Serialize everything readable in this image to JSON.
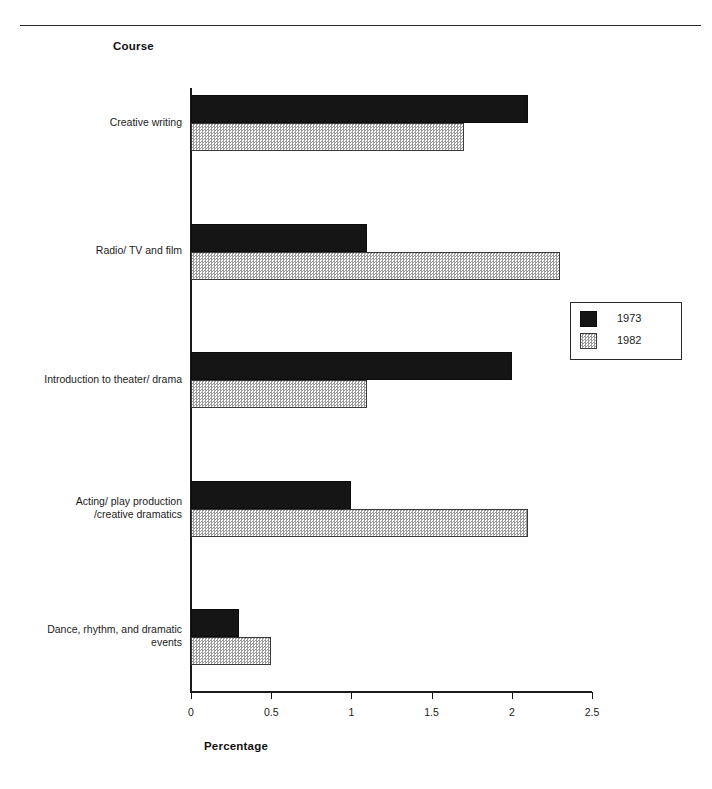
{
  "header": {
    "axis_group_title": "Course"
  },
  "legend": {
    "position": "right-middle",
    "entries": [
      {
        "label": "1973",
        "swatch": "solid-black-swatch"
      },
      {
        "label": "1982",
        "swatch": "gray-hatched-swatch"
      }
    ]
  },
  "axis": {
    "x_title": "Percentage",
    "x_ticks": [
      "0",
      "0.5",
      "1",
      "1.5",
      "2",
      "2.5"
    ]
  },
  "categories": [
    {
      "line1": "Creative writing",
      "line2": ""
    },
    {
      "line1": "Radio/ TV and film",
      "line2": ""
    },
    {
      "line1": "Introduction to theater/ drama",
      "line2": ""
    },
    {
      "line1": "Acting/ play production",
      "line2": "/creative dramatics"
    },
    {
      "line1": "Dance, rhythm, and dramatic",
      "line2": "events"
    }
  ],
  "chart_data": {
    "type": "bar",
    "orientation": "horizontal",
    "title": "",
    "subtitle": "",
    "xlabel": "Percentage",
    "ylabel": "Course",
    "xlim": [
      0,
      2.5
    ],
    "xticks": [
      0,
      0.5,
      1,
      1.5,
      2,
      2.5
    ],
    "grid": false,
    "legend_position": "right",
    "categories": [
      "Creative writing",
      "Radio/ TV and film",
      "Introduction to theater/ drama",
      "Acting/ play production /creative dramatics",
      "Dance, rhythm, and dramatic events"
    ],
    "series": [
      {
        "name": "1973",
        "color": "#151515",
        "fill": "solid",
        "values": [
          2.1,
          1.1,
          2.0,
          1.0,
          0.3
        ]
      },
      {
        "name": "1982",
        "color": "#9b9b9b",
        "fill": "hatched",
        "values": [
          1.7,
          2.3,
          1.1,
          2.1,
          0.5
        ]
      }
    ]
  }
}
